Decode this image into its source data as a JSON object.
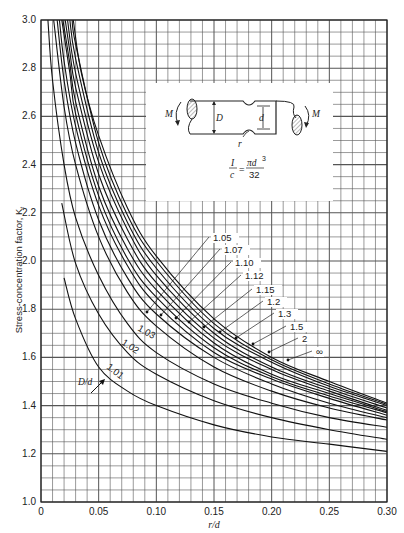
{
  "chart_data": {
    "type": "line",
    "title": "",
    "xlabel": "r/d",
    "ylabel": "Stress-concentration factor, K_t",
    "xlim": [
      0,
      0.3
    ],
    "ylim": [
      1.0,
      3.0
    ],
    "x_ticks": [
      "0",
      "0.05",
      "0.10",
      "0.15",
      "0.20",
      "0.25",
      "0.30"
    ],
    "y_ticks": [
      "1.0",
      "1.2",
      "1.4",
      "1.6",
      "1.8",
      "2.0",
      "2.2",
      "2.4",
      "2.6",
      "2.8",
      "3.0"
    ],
    "grid": true,
    "grid_minor_x": 0.01,
    "grid_minor_y": 0.05,
    "legend_title": "D/d",
    "series": [
      {
        "name": "1.01",
        "x": [
          0.02,
          0.03,
          0.05,
          0.075,
          0.1,
          0.15,
          0.2,
          0.25,
          0.3
        ],
        "y": [
          1.93,
          1.76,
          1.56,
          1.46,
          1.4,
          1.32,
          1.27,
          1.24,
          1.21
        ]
      },
      {
        "name": "1.02",
        "x": [
          0.018,
          0.03,
          0.05,
          0.075,
          0.1,
          0.15,
          0.2,
          0.25,
          0.3
        ],
        "y": [
          2.24,
          1.99,
          1.78,
          1.62,
          1.53,
          1.42,
          1.35,
          1.3,
          1.26
        ]
      },
      {
        "name": "1.03",
        "x": [
          0.006,
          0.01,
          0.02,
          0.03,
          0.05,
          0.075,
          0.1,
          0.15,
          0.2,
          0.25,
          0.3
        ],
        "y": [
          3.0,
          2.75,
          2.4,
          2.18,
          1.94,
          1.74,
          1.62,
          1.49,
          1.41,
          1.35,
          1.31
        ]
      },
      {
        "name": "1.05",
        "x": [
          0.011,
          0.02,
          0.03,
          0.05,
          0.075,
          0.1,
          0.15,
          0.2,
          0.25,
          0.3
        ],
        "y": [
          3.0,
          2.64,
          2.4,
          2.1,
          1.87,
          1.73,
          1.56,
          1.46,
          1.39,
          1.34
        ]
      },
      {
        "name": "1.07",
        "x": [
          0.014,
          0.02,
          0.03,
          0.05,
          0.075,
          0.1,
          0.15,
          0.2,
          0.25,
          0.3
        ],
        "y": [
          3.0,
          2.75,
          2.49,
          2.17,
          1.93,
          1.78,
          1.6,
          1.49,
          1.41,
          1.35
        ]
      },
      {
        "name": "1.10",
        "x": [
          0.016,
          0.02,
          0.03,
          0.05,
          0.075,
          0.1,
          0.15,
          0.2,
          0.25,
          0.3
        ],
        "y": [
          3.0,
          2.83,
          2.56,
          2.23,
          1.98,
          1.82,
          1.62,
          1.51,
          1.43,
          1.36
        ]
      },
      {
        "name": "1.12",
        "x": [
          0.018,
          0.025,
          0.03,
          0.05,
          0.075,
          0.1,
          0.15,
          0.2,
          0.25,
          0.3
        ],
        "y": [
          3.0,
          2.78,
          2.61,
          2.27,
          2.01,
          1.85,
          1.64,
          1.52,
          1.44,
          1.37
        ]
      },
      {
        "name": "1.15",
        "x": [
          0.019,
          0.025,
          0.03,
          0.05,
          0.075,
          0.1,
          0.15,
          0.2,
          0.25,
          0.3
        ],
        "y": [
          3.0,
          2.82,
          2.66,
          2.31,
          2.05,
          1.88,
          1.66,
          1.53,
          1.45,
          1.375
        ]
      },
      {
        "name": "1.2",
        "x": [
          0.021,
          0.025,
          0.03,
          0.05,
          0.075,
          0.1,
          0.15,
          0.2,
          0.25,
          0.3
        ],
        "y": [
          3.0,
          2.87,
          2.72,
          2.36,
          2.09,
          1.91,
          1.68,
          1.55,
          1.46,
          1.38
        ]
      },
      {
        "name": "1.3",
        "x": [
          0.023,
          0.03,
          0.05,
          0.075,
          0.1,
          0.15,
          0.2,
          0.25,
          0.3
        ],
        "y": [
          3.0,
          2.78,
          2.41,
          2.13,
          1.94,
          1.7,
          1.56,
          1.47,
          1.39
        ]
      },
      {
        "name": "1.5",
        "x": [
          0.025,
          0.03,
          0.05,
          0.075,
          0.1,
          0.15,
          0.2,
          0.25,
          0.3
        ],
        "y": [
          3.0,
          2.84,
          2.45,
          2.16,
          1.97,
          1.72,
          1.58,
          1.48,
          1.4
        ]
      },
      {
        "name": "2",
        "x": [
          0.027,
          0.03,
          0.05,
          0.075,
          0.1,
          0.15,
          0.2,
          0.25,
          0.3
        ],
        "y": [
          3.0,
          2.9,
          2.49,
          2.19,
          2.0,
          1.74,
          1.59,
          1.49,
          1.405
        ]
      },
      {
        "name": "∞",
        "x": [
          0.028,
          0.035,
          0.05,
          0.075,
          0.1,
          0.15,
          0.2,
          0.25,
          0.3
        ],
        "y": [
          3.0,
          2.78,
          2.52,
          2.22,
          2.02,
          1.76,
          1.6,
          1.5,
          1.41
        ]
      }
    ],
    "annotations": {
      "dd_label": "D/d",
      "curve_labels": [
        "1.01",
        "1.02",
        "1.03",
        "1.05",
        "1.07",
        "1.10",
        "1.12",
        "1.15",
        "1.2",
        "1.3",
        "1.5",
        "2",
        "∞"
      ],
      "inset": {
        "labels": [
          "M",
          "D",
          "d",
          "r",
          "M"
        ],
        "formula_num": "I",
        "formula_den": "c",
        "formula_rhs_num": "πd³",
        "formula_rhs_den": "32"
      }
    }
  },
  "axes": {
    "xlabel": "r/d",
    "ylabel": "Stress-concentration factor, K",
    "ylabel_sub": "t"
  },
  "inset": {
    "M_left": "M",
    "M_right": "M",
    "D": "D",
    "d": "d",
    "r": "r",
    "I": "I",
    "c": "c",
    "eq": "=",
    "pi_d3": "πd",
    "exp": "3",
    "den": "32"
  },
  "legend_dd": "D/d"
}
